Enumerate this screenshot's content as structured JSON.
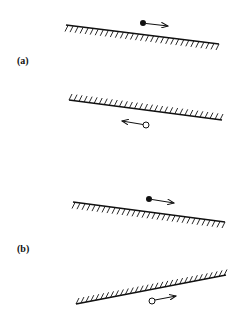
{
  "panels": [
    {
      "label": "(a)",
      "upper_wall": {
        "hatch_side": "below"
      },
      "lower_wall": {
        "hatch_side": "above"
      },
      "particles": [
        {
          "type": "filled",
          "direction": "right"
        },
        {
          "type": "open",
          "direction": "left"
        }
      ]
    },
    {
      "label": "(b)",
      "upper_wall": {
        "hatch_side": "below"
      },
      "lower_wall": {
        "hatch_side": "above"
      },
      "particles": [
        {
          "type": "filled",
          "direction": "right"
        },
        {
          "type": "open",
          "direction": "right"
        }
      ]
    }
  ],
  "colors": {
    "ink": "#111111",
    "background": "#ffffff"
  }
}
